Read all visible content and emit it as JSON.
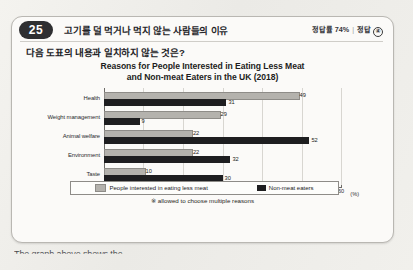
{
  "header": {
    "number": "25",
    "title": "고기를 덜 먹거나 먹지 않는 사람들의 이유",
    "accuracy_label": "정답률 74%",
    "separator": "|",
    "answer_label": "정답",
    "answer_choice": "④"
  },
  "question": {
    "text": "다음 도표의 내용과 일치하지 않는 것은?"
  },
  "chart_data": {
    "type": "bar",
    "orientation": "horizontal",
    "title_line1": "Reasons for People Interested in Eating Less Meat",
    "title_line2": "and Non-meat Eaters in the UK (2018)",
    "categories": [
      "Health",
      "Weight management",
      "Animal welfare",
      "Environment",
      "Taste"
    ],
    "series": [
      {
        "name": "People interested in eating less meat",
        "color": "#b4b2ad",
        "values": [
          49,
          29,
          22,
          22,
          10
        ]
      },
      {
        "name": "Non-meat eaters",
        "color": "#1e1e20",
        "values": [
          31,
          9,
          52,
          32,
          30
        ]
      }
    ],
    "xlabel": "(%)",
    "ylabel": "",
    "xlim": [
      0,
      60
    ],
    "xticks": [
      0,
      10,
      20,
      30,
      40,
      50,
      60
    ],
    "grid": true,
    "legend_position": "bottom",
    "footnote": "※ allowed to choose multiple reasons"
  },
  "below_text": "The graph above shows the"
}
